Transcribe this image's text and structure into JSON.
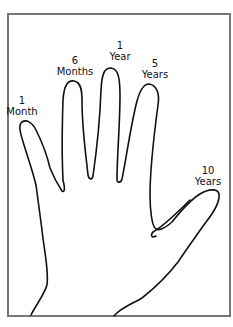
{
  "diagram": {
    "type": "hand outline with timeline labels on fingertips",
    "colors": {
      "frame": "#777777",
      "outline": "#111111",
      "background": "#ffffff"
    },
    "labels": [
      {
        "finger": "pinky",
        "number": "1",
        "unit": "Month"
      },
      {
        "finger": "ring",
        "number": "6",
        "unit": "Months"
      },
      {
        "finger": "middle",
        "number": "1",
        "unit": "Year"
      },
      {
        "finger": "index",
        "number": "5",
        "unit": "Years"
      },
      {
        "finger": "thumb",
        "number": "10",
        "unit": "Years"
      }
    ]
  }
}
